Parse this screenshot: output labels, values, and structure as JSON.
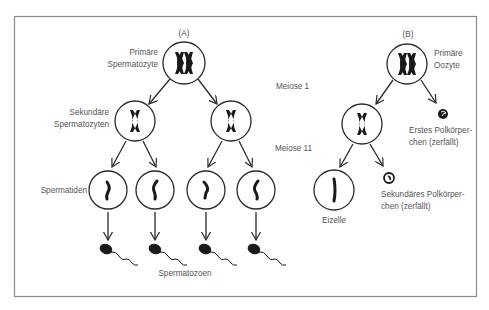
{
  "figure": {
    "panel_a": {
      "label": "(A)",
      "primary_cell": "Primäre\nSpermatozyte",
      "primary_line1": "Primäre",
      "primary_line2": "Spermatozyte",
      "secondary_line1": "Sekundäre",
      "secondary_line2": "Spermatozyten",
      "spermatids": "Spermatiden",
      "spermatozoa": "Spermatozoen"
    },
    "stages": {
      "meiosis_1": "Meiose 1",
      "meiosis_2": "Meiose 11"
    },
    "panel_b": {
      "label": "(B)",
      "primary_line1": "Primäre",
      "primary_line2": "Oozyte",
      "first_polar_line1": "Erstes Polkörper-",
      "first_polar_line2": "chen (zerfällt)",
      "second_polar_line1": "Sekundäres Polkörper-",
      "second_polar_line2": "chen (zerfällt)",
      "egg_cell": "Eizelle"
    },
    "colors": {
      "stroke": "#2a2a2a",
      "text": "#555555",
      "border": "#8a8a8a"
    }
  }
}
